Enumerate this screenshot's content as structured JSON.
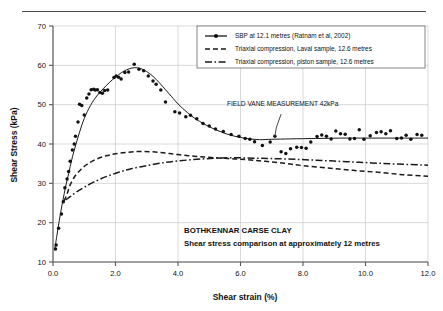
{
  "page": {
    "separator_rule": "horizontal-rule"
  },
  "chart_data": {
    "type": "scatter",
    "title": "BOTHKENNAR CARSE CLAY",
    "subtitle": "Shear stress comparison at approximately 12 metres",
    "xlabel": "Shear strain (%)",
    "ylabel": "Shear Stress (kPa)",
    "xlim": [
      0.0,
      12.0
    ],
    "ylim": [
      10,
      70
    ],
    "xticks": [
      0.0,
      2.0,
      4.0,
      6.0,
      8.0,
      10.0,
      12.0
    ],
    "xticklabels": [
      "0.0",
      "2.0",
      "4.0",
      "6.0",
      "8.0",
      "10.0",
      "12.0"
    ],
    "yticks": [
      10,
      20,
      30,
      40,
      50,
      60,
      70
    ],
    "yticklabels": [
      "10",
      "20",
      "30",
      "40",
      "50",
      "60",
      "70"
    ],
    "grid": true,
    "legend_position": "top-right",
    "annotations": [
      {
        "text": "FIELD VANE MEASUREMENT 42kPa",
        "text_x": 7.35,
        "text_y": 49.6,
        "leader": [
          [
            7.3,
            47.6
          ],
          [
            7.15,
            44.3
          ],
          [
            7.1,
            41.9
          ]
        ]
      }
    ],
    "series": [
      {
        "name": "SBP at 12.1 metres (Ratnam et al, 2002)",
        "style": "solid-with-markers",
        "marker": "filled-circle",
        "line_points": [
          [
            0.05,
            13.0
          ],
          [
            0.12,
            16.5
          ],
          [
            0.2,
            20.5
          ],
          [
            0.3,
            25.0
          ],
          [
            0.4,
            29.0
          ],
          [
            0.5,
            32.5
          ],
          [
            0.6,
            36.0
          ],
          [
            0.7,
            39.0
          ],
          [
            0.85,
            43.0
          ],
          [
            1.0,
            46.5
          ],
          [
            1.2,
            49.8
          ],
          [
            1.4,
            52.2
          ],
          [
            1.6,
            54.0
          ],
          [
            1.8,
            55.6
          ],
          [
            2.0,
            57.0
          ],
          [
            2.2,
            58.2
          ],
          [
            2.4,
            59.0
          ],
          [
            2.6,
            59.4
          ],
          [
            2.8,
            59.2
          ],
          [
            3.0,
            58.4
          ],
          [
            3.2,
            57.2
          ],
          [
            3.4,
            55.6
          ],
          [
            3.6,
            53.8
          ],
          [
            3.8,
            52.0
          ],
          [
            4.0,
            50.2
          ],
          [
            4.3,
            48.0
          ],
          [
            4.6,
            46.2
          ],
          [
            5.0,
            44.4
          ],
          [
            5.4,
            43.0
          ],
          [
            5.8,
            42.0
          ],
          [
            6.2,
            41.4
          ],
          [
            6.6,
            41.1
          ],
          [
            7.0,
            41.2
          ],
          [
            7.6,
            41.3
          ],
          [
            8.4,
            41.4
          ],
          [
            9.2,
            41.5
          ],
          [
            10.0,
            41.5
          ],
          [
            11.0,
            41.5
          ],
          [
            12.0,
            41.5
          ]
        ],
        "points": [
          [
            0.08,
            13.3
          ],
          [
            0.1,
            14.3
          ],
          [
            0.18,
            18.6
          ],
          [
            0.27,
            22.2
          ],
          [
            0.33,
            25.3
          ],
          [
            0.38,
            28.9
          ],
          [
            0.45,
            31.1
          ],
          [
            0.5,
            33.0
          ],
          [
            0.55,
            35.6
          ],
          [
            0.62,
            38.5
          ],
          [
            0.68,
            40.0
          ],
          [
            0.72,
            42.0
          ],
          [
            0.8,
            45.6
          ],
          [
            0.85,
            50.1
          ],
          [
            0.92,
            49.8
          ],
          [
            1.0,
            47.4
          ],
          [
            1.08,
            51.7
          ],
          [
            1.15,
            52.7
          ],
          [
            1.22,
            53.8
          ],
          [
            1.3,
            53.9
          ],
          [
            1.35,
            53.7
          ],
          [
            1.42,
            53.8
          ],
          [
            1.5,
            53.1
          ],
          [
            1.58,
            52.9
          ],
          [
            1.65,
            53.6
          ],
          [
            1.75,
            53.7
          ],
          [
            1.95,
            56.9
          ],
          [
            2.02,
            57.3
          ],
          [
            2.1,
            57.0
          ],
          [
            2.18,
            56.5
          ],
          [
            2.3,
            58.2
          ],
          [
            2.42,
            58.3
          ],
          [
            2.6,
            60.3
          ],
          [
            2.75,
            59.0
          ],
          [
            2.9,
            58.6
          ],
          [
            3.05,
            57.3
          ],
          [
            3.2,
            56.0
          ],
          [
            3.3,
            55.2
          ],
          [
            3.45,
            53.7
          ],
          [
            3.6,
            50.7
          ],
          [
            3.9,
            48.2
          ],
          [
            4.05,
            47.9
          ],
          [
            4.25,
            46.9
          ],
          [
            4.4,
            47.3
          ],
          [
            4.6,
            46.4
          ],
          [
            4.8,
            45.2
          ],
          [
            5.0,
            44.6
          ],
          [
            5.2,
            43.8
          ],
          [
            5.45,
            43.2
          ],
          [
            5.7,
            42.4
          ],
          [
            5.95,
            42.0
          ],
          [
            6.15,
            41.4
          ],
          [
            6.3,
            41.2
          ],
          [
            6.45,
            40.6
          ],
          [
            6.7,
            39.6
          ],
          [
            6.95,
            40.5
          ],
          [
            7.1,
            42.0
          ],
          [
            7.3,
            38.0
          ],
          [
            7.45,
            37.6
          ],
          [
            7.6,
            38.8
          ],
          [
            7.8,
            39.2
          ],
          [
            7.95,
            39.1
          ],
          [
            8.1,
            38.9
          ],
          [
            8.25,
            40.5
          ],
          [
            8.45,
            41.9
          ],
          [
            8.6,
            42.3
          ],
          [
            8.75,
            42.0
          ],
          [
            8.9,
            41.3
          ],
          [
            9.05,
            43.3
          ],
          [
            9.2,
            42.6
          ],
          [
            9.35,
            42.5
          ],
          [
            9.5,
            41.3
          ],
          [
            9.65,
            41.4
          ],
          [
            9.8,
            43.6
          ],
          [
            9.95,
            41.2
          ],
          [
            10.15,
            42.1
          ],
          [
            10.35,
            42.9
          ],
          [
            10.5,
            43.1
          ],
          [
            10.65,
            42.6
          ],
          [
            10.8,
            43.4
          ],
          [
            11.0,
            41.4
          ],
          [
            11.15,
            41.5
          ],
          [
            11.3,
            42.2
          ],
          [
            11.45,
            41.2
          ],
          [
            11.65,
            42.4
          ],
          [
            11.8,
            42.2
          ]
        ]
      },
      {
        "name": "Triaxial compression, Laval sample, 12.6 metres",
        "style": "dashed",
        "line_points": [
          [
            0.35,
            25.5
          ],
          [
            0.45,
            27.3
          ],
          [
            0.55,
            29.6
          ],
          [
            0.7,
            31.8
          ],
          [
            0.9,
            33.6
          ],
          [
            1.1,
            34.9
          ],
          [
            1.4,
            36.2
          ],
          [
            1.7,
            37.0
          ],
          [
            2.0,
            37.5
          ],
          [
            2.4,
            37.9
          ],
          [
            2.8,
            38.1
          ],
          [
            3.2,
            38.0
          ],
          [
            3.6,
            37.7
          ],
          [
            4.0,
            37.3
          ],
          [
            4.5,
            36.9
          ],
          [
            5.0,
            36.6
          ],
          [
            5.6,
            36.3
          ],
          [
            6.2,
            36.0
          ],
          [
            6.8,
            35.6
          ],
          [
            7.4,
            35.1
          ],
          [
            8.0,
            34.5
          ],
          [
            8.8,
            33.9
          ],
          [
            9.6,
            33.3
          ],
          [
            10.4,
            32.8
          ],
          [
            11.2,
            32.2
          ],
          [
            12.0,
            31.8
          ]
        ]
      },
      {
        "name": "Triaxial compression, piston sample, 12.6 metres",
        "style": "dash-dot",
        "line_points": [
          [
            0.4,
            25.8
          ],
          [
            0.55,
            26.6
          ],
          [
            0.75,
            27.8
          ],
          [
            1.0,
            29.0
          ],
          [
            1.3,
            30.3
          ],
          [
            1.7,
            31.7
          ],
          [
            2.1,
            32.8
          ],
          [
            2.5,
            33.7
          ],
          [
            3.0,
            34.5
          ],
          [
            3.5,
            35.2
          ],
          [
            4.0,
            35.7
          ],
          [
            4.6,
            36.1
          ],
          [
            5.2,
            36.4
          ],
          [
            5.8,
            36.5
          ],
          [
            6.4,
            36.4
          ],
          [
            7.0,
            36.3
          ],
          [
            7.8,
            36.1
          ],
          [
            8.6,
            35.8
          ],
          [
            9.4,
            35.5
          ],
          [
            10.2,
            35.2
          ],
          [
            11.0,
            34.9
          ],
          [
            12.0,
            34.6
          ]
        ]
      }
    ]
  }
}
